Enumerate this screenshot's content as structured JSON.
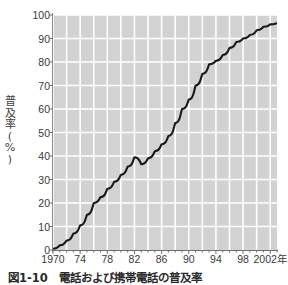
{
  "figure": {
    "caption": "図1-10　電話および携帯電話の普及率"
  },
  "chart_data": {
    "type": "line",
    "title": "",
    "subtitle": "",
    "xlabel": "",
    "ylabel": "普及率（%）",
    "ylabel_vertical": "普\n及\n率\n(\n%\n)",
    "xlim": [
      1970,
      2003
    ],
    "ylim": [
      0,
      100
    ],
    "grid": true,
    "grid_color": "#ffffff",
    "plot_background": "#d2d2d2",
    "line_color": "#1a1a1a",
    "legend": null,
    "legend_position": "none",
    "x_tick_labels": [
      "1970",
      "74",
      "78",
      "82",
      "86",
      "90",
      "94",
      "98",
      "2002年"
    ],
    "x_tick_values": [
      1970,
      1974,
      1978,
      1982,
      1986,
      1990,
      1994,
      1998,
      2002
    ],
    "x_minor_tick_interval": 1,
    "y_tick_labels": [
      "0",
      "10",
      "20",
      "30",
      "40",
      "50",
      "60",
      "70",
      "80",
      "90",
      "100"
    ],
    "y_tick_values": [
      0,
      10,
      20,
      30,
      40,
      50,
      60,
      70,
      80,
      90,
      100
    ],
    "series": [
      {
        "name": "普及率",
        "x": [
          1970,
          1971,
          1972,
          1973,
          1974,
          1975,
          1976,
          1977,
          1978,
          1979,
          1980,
          1981,
          1982,
          1983,
          1984,
          1985,
          1986,
          1987,
          1988,
          1989,
          1990,
          1991,
          1992,
          1993,
          1994,
          1995,
          1996,
          1997,
          1998,
          1999,
          2000,
          2001,
          2002,
          2003
        ],
        "values": [
          0.5,
          2.0,
          4.0,
          7.0,
          10.5,
          15.0,
          20.0,
          22.5,
          26.0,
          29.0,
          32.0,
          35.5,
          39.5,
          36.5,
          39.0,
          42.0,
          45.0,
          48.5,
          54.0,
          60.0,
          64.0,
          70.0,
          75.0,
          79.0,
          80.5,
          83.0,
          86.0,
          88.5,
          90.0,
          91.5,
          93.5,
          95.0,
          96.0,
          96.5
        ]
      }
    ]
  }
}
